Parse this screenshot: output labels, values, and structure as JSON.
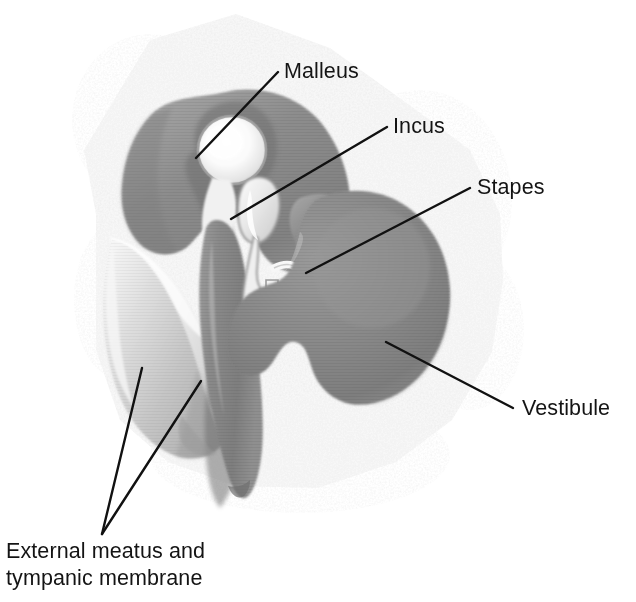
{
  "figure": {
    "type": "anatomical-illustration",
    "background_color": "#ffffff",
    "bone_texture_color": "#e9e9e9",
    "ossicle_dark_color": "#8b8b8b",
    "ossicle_light_color": "#f2f2f2",
    "membrane_color": "#c8c8c8",
    "leader_line_color": "#111111"
  },
  "labels": [
    {
      "id": "malleus",
      "text": "Malleus",
      "text_x": 284,
      "text_y": 78,
      "anchor": "start",
      "leader": {
        "x1": 278,
        "y1": 72,
        "x2": 196,
        "y2": 158
      }
    },
    {
      "id": "incus",
      "text": "Incus",
      "text_x": 393,
      "text_y": 133,
      "anchor": "start",
      "leader": {
        "x1": 387,
        "y1": 127,
        "x2": 231,
        "y2": 219
      }
    },
    {
      "id": "stapes",
      "text": "Stapes",
      "text_x": 477,
      "text_y": 194,
      "anchor": "start",
      "leader": {
        "x1": 470,
        "y1": 188,
        "x2": 306,
        "y2": 273
      }
    },
    {
      "id": "vestibule",
      "text": "Vestibule",
      "text_x": 522,
      "text_y": 415,
      "anchor": "start",
      "leader": {
        "x1": 386,
        "y1": 342,
        "x2": 513,
        "y2": 408
      }
    },
    {
      "id": "external-meatus-tympanic-membrane",
      "text_line1": "External meatus and",
      "text_line2": "tympanic membrane",
      "text_x": 6,
      "text_y1": 558,
      "text_y2": 585,
      "anchor": "start",
      "leader_a": {
        "x1": 102,
        "y1": 534,
        "x2": 142,
        "y2": 368
      },
      "leader_b": {
        "x1": 102,
        "y1": 534,
        "x2": 201,
        "y2": 381
      }
    }
  ]
}
